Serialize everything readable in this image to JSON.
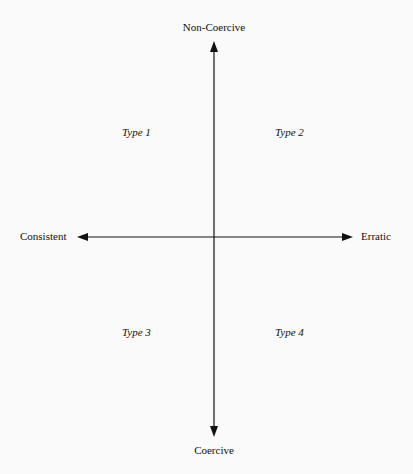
{
  "diagram": {
    "type": "quadrant",
    "axes": {
      "top": "Non-Coercive",
      "bottom": "Coercive",
      "left": "Consistent",
      "right": "Erratic"
    },
    "quadrants": {
      "top_left": "Type 1",
      "top_right": "Type 2",
      "bottom_left": "Type 3",
      "bottom_right": "Type 4"
    },
    "colors": {
      "line": "#111111",
      "background": "#fafafa"
    }
  }
}
